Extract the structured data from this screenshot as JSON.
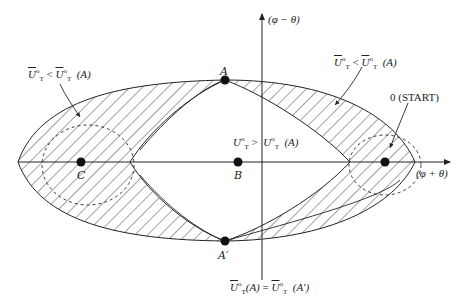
{
  "diagram": {
    "axes": {
      "horizontal_label": "(φ + θ)",
      "vertical_label": "(φ − θ)"
    },
    "points": {
      "A": "A",
      "A_prime": "A′",
      "B": "B",
      "C": "C",
      "start": "0 (START)"
    },
    "regions": {
      "upper_left_label_lhs": "U",
      "upper_left_label_rel": "<",
      "upper_left_label_rhs": "U",
      "upper_left_label_arg": "(A)",
      "upper_right_label_lhs": "U",
      "upper_right_label_rel": "<",
      "upper_right_label_rhs": "U",
      "upper_right_label_arg": "(A)",
      "center_label_lhs": "U",
      "center_label_rel": ">",
      "center_label_rhs": "U",
      "center_label_arg": "(A)",
      "bottom_label_lhs": "U",
      "bottom_label_lhs_arg": "(A)",
      "bottom_label_rel": "=",
      "bottom_label_rhs": "U",
      "bottom_label_rhs_arg": "(A′)",
      "superscript": "o",
      "subscript": "T"
    },
    "colors": {
      "line": "#222222",
      "hatch": "#333333",
      "background": "#ffffff"
    }
  }
}
